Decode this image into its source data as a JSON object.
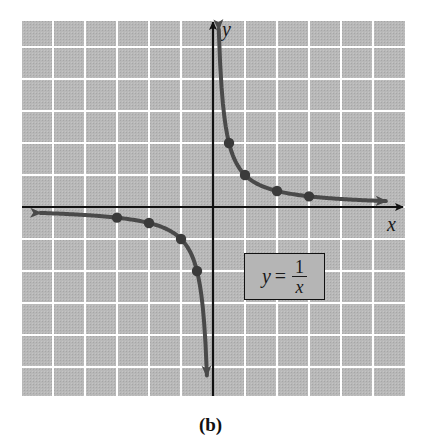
{
  "figure": {
    "caption": "(b)",
    "x_axis_label": "x",
    "y_axis_label": "y",
    "equation": {
      "lhs": "y",
      "equals": "=",
      "numerator": "1",
      "denominator": "x"
    },
    "colors": {
      "grid_background": "#b5b5b5",
      "grid_lines": "#ffffff",
      "axes": "#111111",
      "curve": "#4a4a4a",
      "points": "#3a3a3a"
    }
  },
  "chart_data": {
    "type": "line",
    "title": "",
    "equation": "y = 1/x",
    "xlabel": "x",
    "ylabel": "y",
    "xlim": [
      -6,
      6
    ],
    "ylim": [
      -6,
      6
    ],
    "grid": true,
    "grid_spacing": 1,
    "caption": "(b)",
    "series": [
      {
        "name": "y = 1/x (x > 0)",
        "points": [
          {
            "x": 0.5,
            "y": 2
          },
          {
            "x": 1,
            "y": 1
          },
          {
            "x": 2,
            "y": 0.5
          },
          {
            "x": 3,
            "y": 0.33
          }
        ]
      },
      {
        "name": "y = 1/x (x < 0)",
        "points": [
          {
            "x": -3,
            "y": -0.33
          },
          {
            "x": -2,
            "y": -0.5
          },
          {
            "x": -1,
            "y": -1
          },
          {
            "x": -0.5,
            "y": -2
          }
        ]
      }
    ],
    "annotations": [
      "y = 1/x"
    ]
  }
}
